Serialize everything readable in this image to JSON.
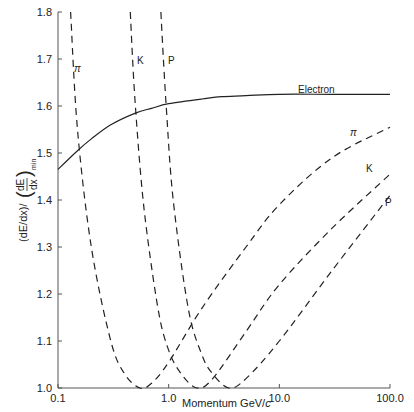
{
  "chart_data": {
    "type": "line",
    "title": "",
    "xlabel": "Momentum GeV/c",
    "ylabel": "(dE/dx)/(dE/dx)_min",
    "xscale": "log",
    "xlim": [
      0.1,
      100.0
    ],
    "ylim": [
      1.0,
      1.8
    ],
    "grid": false,
    "x_ticks": [
      "0.1",
      "1.0",
      "10.0",
      "100.0"
    ],
    "y_ticks": [
      "1.0",
      "1.1",
      "1.2",
      "1.3",
      "1.4",
      "1.5",
      "1.6",
      "1.7",
      "1.8"
    ],
    "series": [
      {
        "name": "Electron",
        "style": "solid",
        "x": [
          0.1,
          0.15,
          0.2,
          0.3,
          0.5,
          0.7,
          1.0,
          2.0,
          3.0,
          5.0,
          10.0,
          30.0,
          100.0
        ],
        "y": [
          1.465,
          1.505,
          1.53,
          1.56,
          1.585,
          1.595,
          1.605,
          1.615,
          1.62,
          1.622,
          1.625,
          1.625,
          1.625
        ]
      },
      {
        "name": "π",
        "style": "dashed",
        "x": [
          0.13,
          0.15,
          0.2,
          0.3,
          0.4,
          0.55,
          0.7,
          1.0,
          2.0,
          5.0,
          10.0,
          30.0,
          100.0
        ],
        "y": [
          1.8,
          1.55,
          1.3,
          1.1,
          1.03,
          1.0,
          1.01,
          1.055,
          1.17,
          1.3,
          1.39,
          1.49,
          1.555
        ]
      },
      {
        "name": "K",
        "style": "dashed",
        "x": [
          0.45,
          0.5,
          0.6,
          0.8,
          1.0,
          1.3,
          1.8,
          2.5,
          5.0,
          10.0,
          30.0,
          100.0
        ],
        "y": [
          1.8,
          1.6,
          1.38,
          1.17,
          1.08,
          1.03,
          1.0,
          1.02,
          1.12,
          1.22,
          1.34,
          1.455
        ]
      },
      {
        "name": "P",
        "style": "dashed",
        "x": [
          0.85,
          0.95,
          1.1,
          1.5,
          2.0,
          2.5,
          3.5,
          5.0,
          10.0,
          30.0,
          100.0
        ],
        "y": [
          1.8,
          1.6,
          1.4,
          1.17,
          1.07,
          1.03,
          1.0,
          1.02,
          1.1,
          1.25,
          1.41
        ]
      }
    ],
    "annotations": [
      {
        "text": "π",
        "near": "pi-curve-left"
      },
      {
        "text": "K",
        "near": "k-curve-left"
      },
      {
        "text": "P",
        "near": "p-curve-left"
      },
      {
        "text": "Electron",
        "near": "electron-curve"
      },
      {
        "text": "π",
        "near": "pi-curve-right"
      },
      {
        "text": "K",
        "near": "k-curve-right"
      },
      {
        "text": "P",
        "near": "p-curve-right"
      }
    ]
  },
  "labels": {
    "electron": "Electron",
    "pi": "π",
    "k": "K",
    "p": "P",
    "xlabel_main": "Momentum GeV/",
    "xlabel_c": "c",
    "ylabel_left": "(dE/dx)/",
    "ylabel_frac_num": "dE",
    "ylabel_frac_den": "dx",
    "ylabel_sub": "min"
  }
}
